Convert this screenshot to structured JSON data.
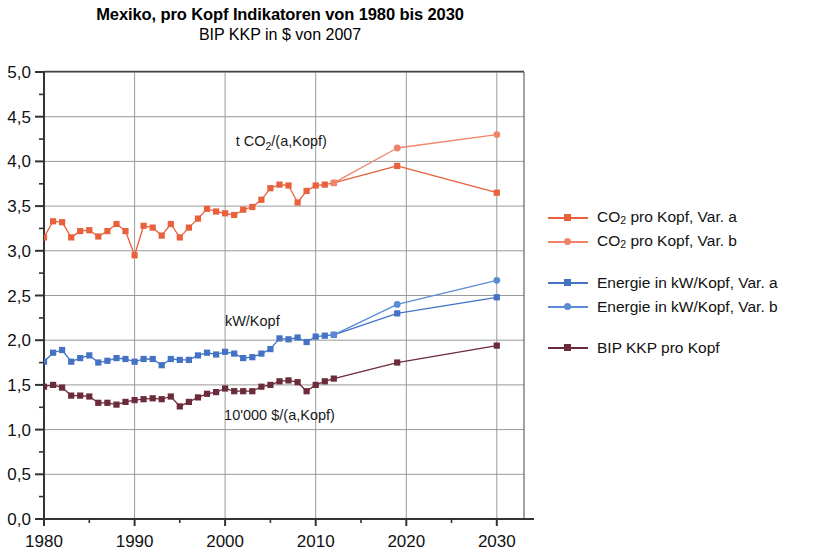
{
  "title": "Mexiko, pro Kopf Indikatoren von 1980 bis 2030",
  "subtitle": "BIP KKP in $ von 2007",
  "colors": {
    "co2": "#E8603C",
    "co2_var_b": "#F0846A",
    "energie": "#4472C4",
    "energie_var_b": "#5B8BD6",
    "bip": "#6B2B3A",
    "grid": "#9A9A9A",
    "axis": "#333333"
  },
  "legend": {
    "items": [
      {
        "label_prefix": "CO",
        "label_sub": "2",
        "label_suffix": " pro Kopf, Var. a",
        "color": "#E8603C",
        "marker": "square"
      },
      {
        "label_prefix": "CO",
        "label_sub": "2",
        "label_suffix": " pro Kopf, Var. b",
        "color": "#F0846A",
        "marker": "round"
      },
      {
        "label_prefix": "Energie in kW/Kopf, Var. a",
        "label_sub": "",
        "label_suffix": "",
        "color": "#4472C4",
        "marker": "square"
      },
      {
        "label_prefix": "Energie in kW/Kopf, Var. b",
        "label_sub": "",
        "label_suffix": "",
        "color": "#5B8BD6",
        "marker": "round"
      },
      {
        "label_prefix": "BIP KKP pro Kopf",
        "label_sub": "",
        "label_suffix": "",
        "color": "#6B2B3A",
        "marker": "square"
      }
    ]
  },
  "annotations": [
    {
      "name": "co2-annotation",
      "text_prefix": "t CO",
      "text_sub": "2",
      "text_suffix": "/(a,Kopf)",
      "x": 2006.2,
      "y": 4.17
    },
    {
      "name": "energy-annotation",
      "text_prefix": "kW/Kopf",
      "text_sub": "",
      "text_suffix": "",
      "x": 2003.0,
      "y": 2.16
    },
    {
      "name": "gdp-annotation",
      "text_prefix": "10'000 $/(a,Kopf)",
      "text_sub": "",
      "text_suffix": "",
      "x": 2006.0,
      "y": 1.11
    }
  ],
  "chart_data": {
    "type": "line",
    "title": "Mexiko, pro Kopf Indikatoren von 1980 bis 2030",
    "subtitle": "BIP KKP in $ von 2007",
    "xlabel": "",
    "ylabel": "",
    "xlim": [
      1980,
      2033
    ],
    "ylim": [
      0.0,
      5.0
    ],
    "grid": true,
    "legend_position": "right",
    "x_ticks": [
      1980,
      1990,
      2000,
      2010,
      2020,
      2030
    ],
    "x_tick_labels": [
      "1980",
      "1990",
      "2000",
      "2010",
      "2020",
      "2030"
    ],
    "x_minor_ticks": [
      1985,
      1995,
      2005,
      2015,
      2025
    ],
    "y_ticks": [
      0.0,
      0.5,
      1.0,
      1.5,
      2.0,
      2.5,
      3.0,
      3.5,
      4.0,
      4.5,
      5.0
    ],
    "y_tick_labels": [
      "0,0",
      "0,5",
      "1,0",
      "1,5",
      "2,0",
      "2,5",
      "3,0",
      "3,5",
      "4,0",
      "4,5",
      "5,0"
    ],
    "y_minor_step": 0.25,
    "series": [
      {
        "name": "CO2 pro Kopf, Var. a",
        "color": "#E8603C",
        "marker": "square",
        "x": [
          1980,
          1981,
          1982,
          1983,
          1984,
          1985,
          1986,
          1987,
          1988,
          1989,
          1990,
          1991,
          1992,
          1993,
          1994,
          1995,
          1996,
          1997,
          1998,
          1999,
          2000,
          2001,
          2002,
          2003,
          2004,
          2005,
          2006,
          2007,
          2008,
          2009,
          2010,
          2011,
          2012,
          2019,
          2030
        ],
        "values": [
          3.15,
          3.33,
          3.32,
          3.15,
          3.22,
          3.23,
          3.16,
          3.22,
          3.3,
          3.22,
          2.95,
          3.28,
          3.26,
          3.17,
          3.3,
          3.15,
          3.26,
          3.36,
          3.47,
          3.44,
          3.42,
          3.4,
          3.46,
          3.49,
          3.57,
          3.7,
          3.74,
          3.73,
          3.54,
          3.67,
          3.73,
          3.74,
          3.76,
          3.95,
          3.65
        ]
      },
      {
        "name": "CO2 pro Kopf, Var. b",
        "color": "#F0846A",
        "marker": "round",
        "x": [
          2012,
          2019,
          2030
        ],
        "values": [
          3.76,
          4.15,
          4.3
        ]
      },
      {
        "name": "Energie in kW/Kopf, Var. a",
        "color": "#4472C4",
        "marker": "square",
        "x": [
          1980,
          1981,
          1982,
          1983,
          1984,
          1985,
          1986,
          1987,
          1988,
          1989,
          1990,
          1991,
          1992,
          1993,
          1994,
          1995,
          1996,
          1997,
          1998,
          1999,
          2000,
          2001,
          2002,
          2003,
          2004,
          2005,
          2006,
          2007,
          2008,
          2009,
          2010,
          2011,
          2012,
          2019,
          2030
        ],
        "values": [
          1.76,
          1.86,
          1.89,
          1.76,
          1.8,
          1.83,
          1.75,
          1.77,
          1.8,
          1.79,
          1.76,
          1.79,
          1.79,
          1.72,
          1.79,
          1.78,
          1.78,
          1.83,
          1.86,
          1.84,
          1.87,
          1.85,
          1.8,
          1.81,
          1.85,
          1.9,
          2.02,
          2.01,
          2.03,
          1.98,
          2.04,
          2.05,
          2.06,
          2.3,
          2.48
        ]
      },
      {
        "name": "Energie in kW/Kopf, Var. b",
        "color": "#5B8BD6",
        "marker": "round",
        "x": [
          2012,
          2019,
          2030
        ],
        "values": [
          2.06,
          2.4,
          2.67
        ]
      },
      {
        "name": "BIP KKP pro Kopf",
        "color": "#6B2B3A",
        "marker": "square",
        "x": [
          1980,
          1981,
          1982,
          1983,
          1984,
          1985,
          1986,
          1987,
          1988,
          1989,
          1990,
          1991,
          1992,
          1993,
          1994,
          1995,
          1996,
          1997,
          1998,
          1999,
          2000,
          2001,
          2002,
          2003,
          2004,
          2005,
          2006,
          2007,
          2008,
          2009,
          2010,
          2011,
          2012,
          2019,
          2030
        ],
        "values": [
          1.48,
          1.5,
          1.47,
          1.38,
          1.38,
          1.37,
          1.3,
          1.3,
          1.28,
          1.31,
          1.33,
          1.34,
          1.35,
          1.34,
          1.37,
          1.26,
          1.31,
          1.36,
          1.4,
          1.42,
          1.46,
          1.43,
          1.43,
          1.43,
          1.48,
          1.5,
          1.54,
          1.55,
          1.53,
          1.43,
          1.5,
          1.54,
          1.57,
          1.75,
          1.94
        ]
      }
    ]
  }
}
